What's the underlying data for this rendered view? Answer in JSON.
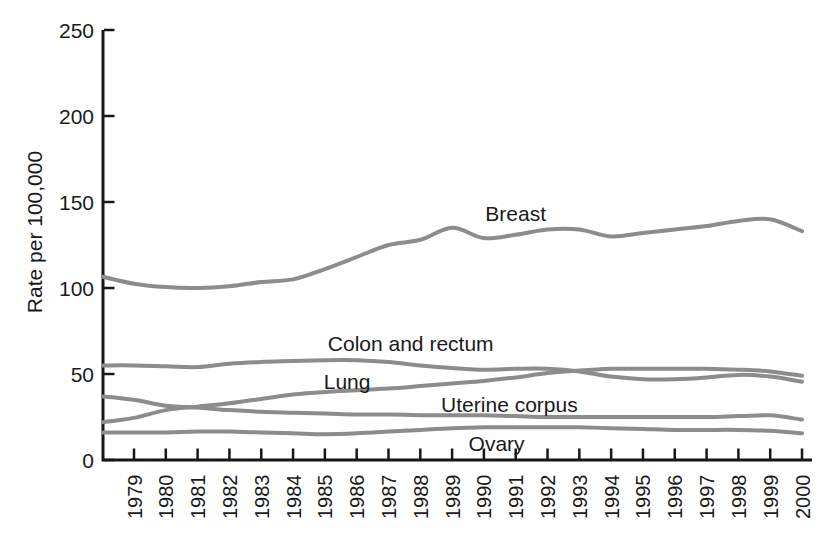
{
  "chart_data": {
    "type": "line",
    "title": "",
    "xlabel": "",
    "ylabel": "Rate per 100,000",
    "ylim": [
      0,
      250
    ],
    "yticks": [
      0,
      50,
      100,
      150,
      200,
      250
    ],
    "grid": false,
    "legend_position": "inline-labels",
    "line_color": "#8c8c8c",
    "axis_color": "#161616",
    "text_color": "#1a1a1a",
    "categories": [
      "1979",
      "1980",
      "1981",
      "1982",
      "1983",
      "1984",
      "1985",
      "1986",
      "1987",
      "1988",
      "1989",
      "1990",
      "1991",
      "1992",
      "1993",
      "1994",
      "1995",
      "1996",
      "1997",
      "1998",
      "1999",
      "2000"
    ],
    "series": [
      {
        "name": "Breast",
        "axis_start": 106.5,
        "values": [
          102.5,
          100.5,
          100,
          101,
          103.5,
          105,
          111,
          118,
          125,
          128,
          135,
          129,
          131,
          134,
          134,
          130,
          132,
          134,
          136,
          139,
          140,
          133
        ]
      },
      {
        "name": "Colon and rectum",
        "axis_start": 55,
        "values": [
          55,
          54.5,
          54,
          56,
          57,
          57.5,
          58,
          58,
          57,
          55,
          53.5,
          52.5,
          53,
          53,
          51.5,
          48.5,
          47,
          47,
          48,
          49.5,
          48.5,
          45.5
        ]
      },
      {
        "name": "Lung",
        "axis_start": 22,
        "values": [
          24.5,
          29,
          31,
          33,
          35.5,
          38,
          39.5,
          40.5,
          41.5,
          43,
          44.5,
          46,
          48,
          50.5,
          52,
          53,
          53,
          53,
          53,
          52.5,
          51.5,
          49
        ]
      },
      {
        "name": "Uterine corpus",
        "axis_start": 37,
        "values": [
          35,
          31.5,
          30.5,
          29,
          28,
          27.5,
          27,
          26.5,
          26.5,
          26,
          26,
          26,
          25.5,
          25,
          25,
          25,
          25,
          25,
          25,
          25.5,
          26,
          23.5
        ]
      },
      {
        "name": "Ovary",
        "axis_start": 16,
        "values": [
          16,
          16,
          16.5,
          16.5,
          16,
          15.5,
          15,
          15.5,
          16.5,
          17.5,
          18.5,
          19,
          19,
          19,
          19,
          18.5,
          18,
          17.5,
          17.5,
          17.5,
          17,
          15.5
        ]
      }
    ],
    "annotations": [
      {
        "text": "Breast",
        "year": 1991.0,
        "value": 143.5
      },
      {
        "text": "Colon and rectum",
        "year": 1987.7,
        "value": 68
      },
      {
        "text": "Lung",
        "year": 1985.7,
        "value": 45.5
      },
      {
        "text": "Uterine corpus",
        "year": 1990.8,
        "value": 32.5
      },
      {
        "text": "Ovary",
        "year": 1990.4,
        "value": 9.5
      }
    ]
  }
}
